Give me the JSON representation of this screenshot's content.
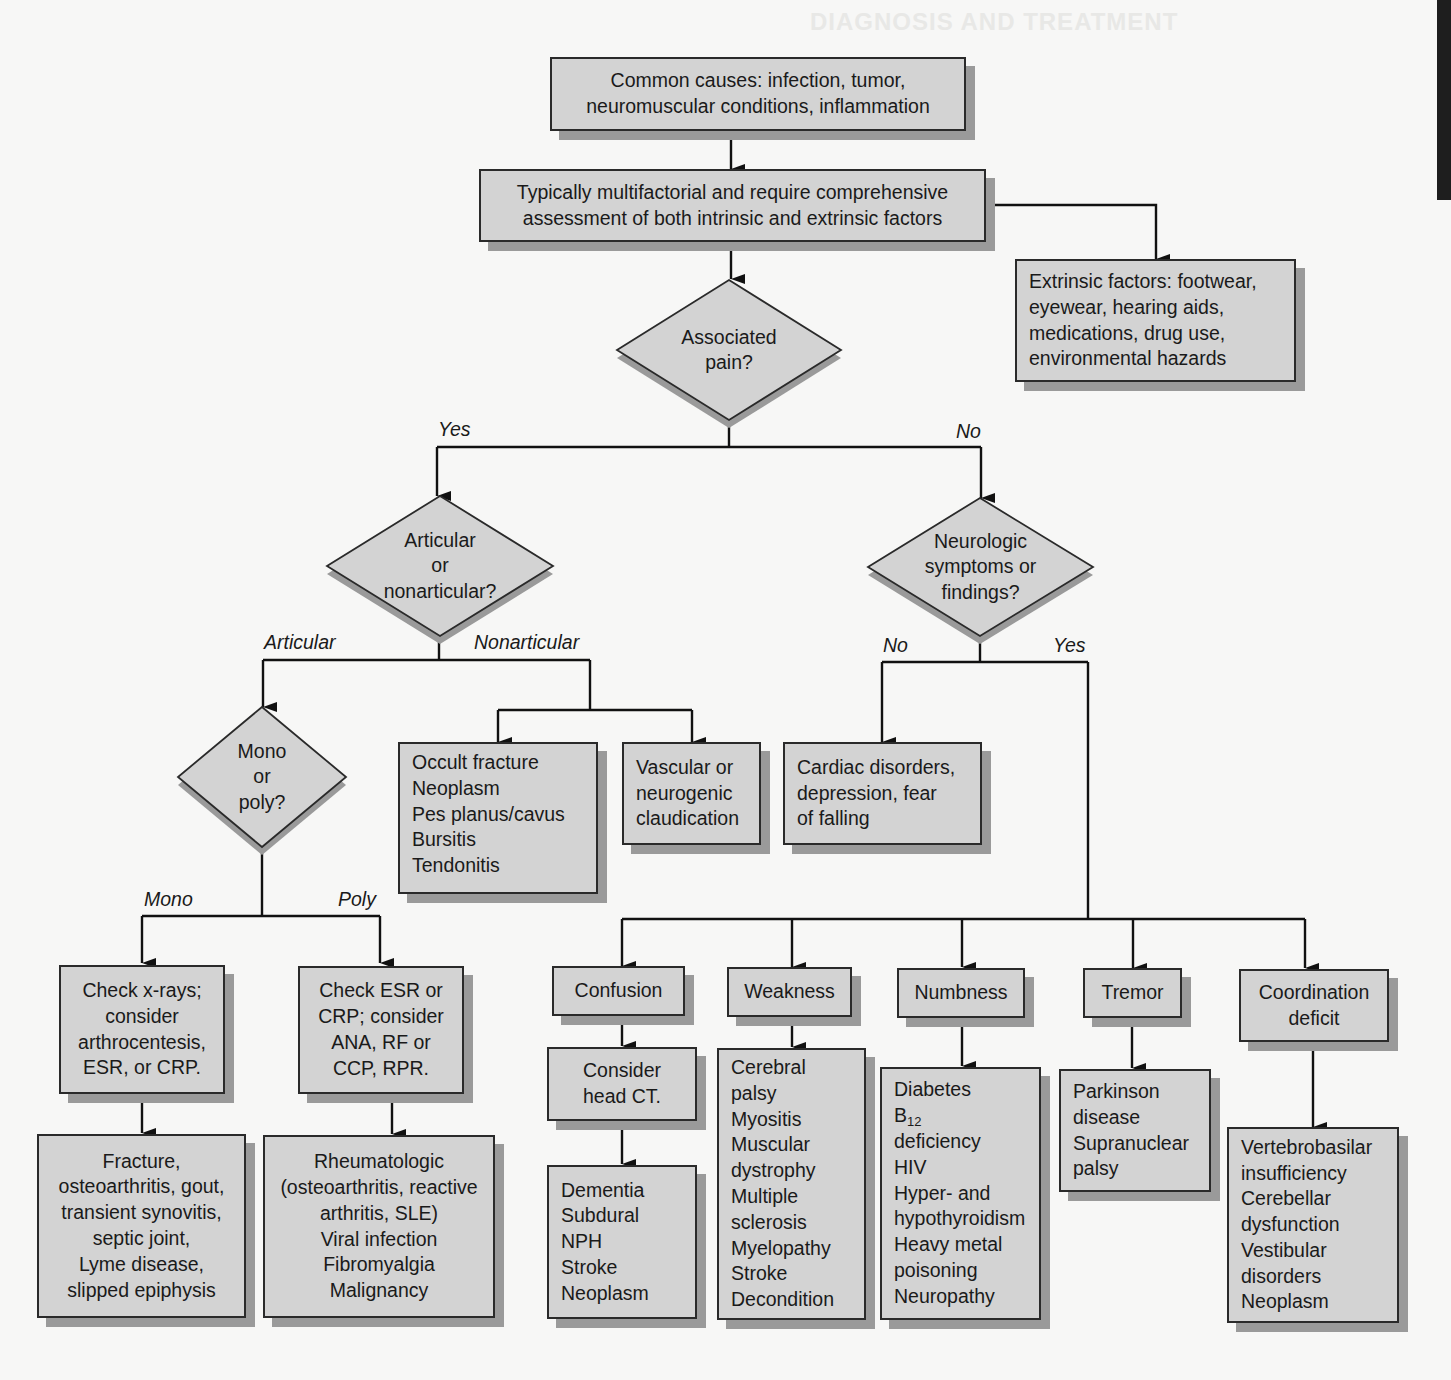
{
  "page": {
    "bleed_through_heading": "DIAGNOSIS AND TREATMENT"
  },
  "colors": {
    "box_fill": "#d3d3d3",
    "box_border": "#2a2a2a",
    "box_shadow": "#9a9a9a",
    "background": "#f7f7f6",
    "edge_tab": "#1e1e1e"
  },
  "nodes": {
    "common_causes": [
      "Common causes: infection, tumor,",
      "neuromuscular conditions, inflammation"
    ],
    "multifactorial": [
      "Typically multifactorial and require comprehensive",
      "assessment of both intrinsic and extrinsic factors"
    ],
    "extrinsic": [
      "Extrinsic factors: footwear,",
      "eyewear, hearing aids,",
      "medications, drug use,",
      "environmental hazards"
    ],
    "pain_question": [
      "Associated",
      "pain?"
    ],
    "articular_question": [
      "Articular",
      "or",
      "nonarticular?"
    ],
    "neuro_question": [
      "Neurologic",
      "symptoms or",
      "findings?"
    ],
    "mono_poly_question": [
      "Mono",
      "or",
      "poly?"
    ],
    "nonarticular_causes": [
      "Occult fracture",
      "Neoplasm",
      "Pes planus/cavus",
      "Bursitis",
      "Tendonitis"
    ],
    "claudication": [
      "Vascular or",
      "neurogenic",
      "claudication"
    ],
    "cardiac": [
      "Cardiac disorders,",
      "depression, fear",
      "of falling"
    ],
    "mono_workup": [
      "Check x-rays;",
      "consider",
      "arthrocentesis,",
      "ESR, or CRP."
    ],
    "poly_workup": [
      "Check ESR or",
      "CRP; consider",
      "ANA, RF or",
      "CCP, RPR."
    ],
    "mono_dx": [
      "Fracture,",
      "osteoarthritis, gout,",
      "transient synovitis,",
      "septic joint,",
      "Lyme disease,",
      "slipped epiphysis"
    ],
    "poly_dx": [
      "Rheumatologic",
      "(osteoarthritis, reactive",
      "arthritis, SLE)",
      "Viral infection",
      "Fibromyalgia",
      "Malignancy"
    ],
    "confusion": [
      "Confusion"
    ],
    "confusion_workup": [
      "Consider",
      "head CT."
    ],
    "confusion_dx": [
      "Dementia",
      "Subdural",
      "NPH",
      "Stroke",
      "Neoplasm"
    ],
    "weakness": [
      "Weakness"
    ],
    "weakness_dx": [
      "Cerebral",
      "palsy",
      "Myositis",
      "Muscular",
      "dystrophy",
      "Multiple",
      "sclerosis",
      "Myelopathy",
      "Stroke",
      "Decondition"
    ],
    "numbness": [
      "Numbness"
    ],
    "numbness_dx": [
      "Diabetes",
      "B12",
      "deficiency",
      "HIV",
      "Hyper- and",
      "hypothyroidism",
      "Heavy metal",
      "poisoning",
      "Neuropathy"
    ],
    "tremor": [
      "Tremor"
    ],
    "tremor_dx": [
      "Parkinson",
      "disease",
      "Supranuclear",
      "palsy"
    ],
    "coordination": [
      "Coordination",
      "deficit"
    ],
    "coordination_dx": [
      "Vertebrobasilar",
      "insufficiency",
      "Cerebellar",
      "dysfunction",
      "Vestibular",
      "disorders",
      "Neoplasm"
    ]
  },
  "edge_labels": {
    "pain_yes": "Yes",
    "pain_no": "No",
    "articular": "Articular",
    "nonarticular": "Nonarticular",
    "neuro_no": "No",
    "neuro_yes": "Yes",
    "mono": "Mono",
    "poly": "Poly"
  }
}
